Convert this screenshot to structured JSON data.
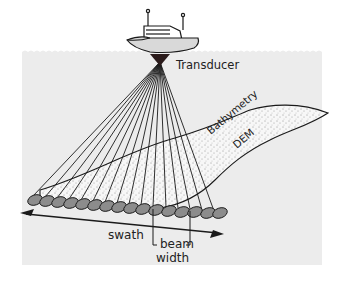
{
  "diagram": {
    "labels": {
      "transducer": "Transducer",
      "bathymetry": "Bathymetry",
      "dem": "DEM",
      "swath": "swath",
      "beam": "beam",
      "width": "width"
    },
    "elements": {
      "vessel": "survey-boat",
      "beam_count": 16,
      "footprint_count": 16
    },
    "colors": {
      "background": "#ffffff",
      "water": "#ececec",
      "outline": "#1a1a1a",
      "footprint": "#8c8c8c",
      "dem_fill": "#f7f7f7",
      "transducer": "#2a1a1a"
    }
  }
}
